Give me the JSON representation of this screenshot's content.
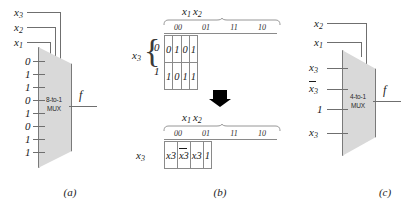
{
  "figure": {
    "captions": {
      "a": "(a)",
      "b": "(b)",
      "c": "(c)"
    }
  },
  "panel_a": {
    "mux_label_line1": "8-to-1",
    "mux_label_line2": "MUX",
    "select_lines": [
      {
        "name": "x3",
        "base": "x",
        "sub": "3"
      },
      {
        "name": "x2",
        "base": "x",
        "sub": "2"
      },
      {
        "name": "x1",
        "base": "x",
        "sub": "1"
      }
    ],
    "data_inputs": [
      "0",
      "1",
      "1",
      "0",
      "1",
      "0",
      "1",
      "1"
    ],
    "output_label": "f"
  },
  "panel_b": {
    "kmap": {
      "col_group_label": {
        "base1": "x",
        "sub1": "1",
        "base2": "x",
        "sub2": "2"
      },
      "col_headers": [
        "00",
        "01",
        "11",
        "10"
      ],
      "row_var": {
        "base": "x",
        "sub": "3"
      },
      "row_headers": [
        "0",
        "1"
      ],
      "rows": [
        [
          "0",
          "1",
          "0",
          "1"
        ],
        [
          "1",
          "0",
          "1",
          "1"
        ]
      ]
    },
    "arrow": "down-arrow",
    "reduced": {
      "col_group_label": {
        "base1": "x",
        "sub1": "1",
        "base2": "x",
        "sub2": "2"
      },
      "col_headers": [
        "00",
        "01",
        "11",
        "10"
      ],
      "row_var": {
        "base": "x",
        "sub": "3"
      },
      "cells": [
        {
          "text": "x",
          "sub": "3",
          "overbar": false
        },
        {
          "text": "x",
          "sub": "3",
          "overbar": true
        },
        {
          "text": "x",
          "sub": "3",
          "overbar": false
        },
        {
          "text": "1",
          "sub": "",
          "overbar": false
        }
      ]
    }
  },
  "panel_c": {
    "mux_label_line1": "4-to-1",
    "mux_label_line2": "MUX",
    "select_lines": [
      {
        "name": "x2",
        "base": "x",
        "sub": "2"
      },
      {
        "name": "x1",
        "base": "x",
        "sub": "1"
      }
    ],
    "data_inputs": [
      {
        "text": "x",
        "sub": "3",
        "overbar": false
      },
      {
        "text": "x",
        "sub": "3",
        "overbar": true
      },
      {
        "text": "1",
        "sub": "",
        "overbar": false
      },
      {
        "text": "x",
        "sub": "3",
        "overbar": false
      }
    ],
    "output_label": "f"
  },
  "colors": {
    "mux_fill": "#d9d9d9",
    "mux_stroke": "#7a7a7a",
    "wire": "#6f6f6f",
    "arrow": "#000000",
    "text": "#1a1a1a",
    "background": "#ffffff"
  }
}
